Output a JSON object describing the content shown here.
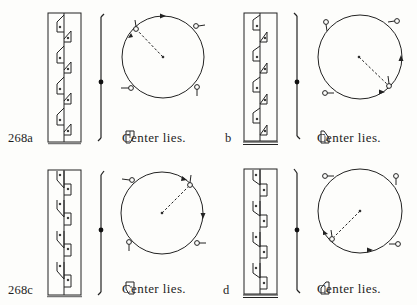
{
  "figure": {
    "number": "268",
    "panels": [
      {
        "id": "a",
        "label": "268a",
        "caption": "Center lies",
        "caption_end": ".",
        "glyph": "tile-rotated-glyph-a",
        "rotation": "counterclockwise start at upper-left, arrows clockwise along top",
        "dashed_from": "upper-left point"
      },
      {
        "id": "b",
        "label": "b",
        "caption": "Center lies",
        "caption_end": ".",
        "glyph": "tile-rotated-glyph-b",
        "dashed_from": "lower-right point"
      },
      {
        "id": "c",
        "label": "268c",
        "caption": "Center lies",
        "caption_end": ".",
        "glyph": "tile-rotated-glyph-c",
        "dashed_from": "upper-right point"
      },
      {
        "id": "d",
        "label": "d",
        "caption": "Center lies",
        "caption_end": ".",
        "glyph": "tile-rotated-glyph-d",
        "dashed_from": "lower-left point"
      }
    ]
  }
}
